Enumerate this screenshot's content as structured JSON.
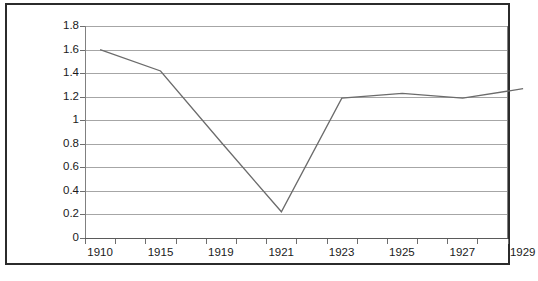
{
  "chart_data": {
    "type": "line",
    "title": "",
    "xlabel": "",
    "ylabel": "",
    "ylim": [
      0,
      1.8
    ],
    "ytick_values": [
      0,
      0.2,
      0.4,
      0.6,
      0.8,
      1,
      1.2,
      1.4,
      1.6,
      1.8
    ],
    "ytick_labels": [
      "0",
      "0.2",
      "0.4",
      "0.6",
      "0.8",
      "1",
      "1.2",
      "1.4",
      "1.6",
      "1.8"
    ],
    "grid": true,
    "grid_axis": "y",
    "legend": false,
    "legend_position": "none",
    "categories": [
      "1910",
      "1915",
      "1919",
      "1921",
      "1923",
      "1925",
      "1927",
      "1929"
    ],
    "xtick_labels": [
      "1910",
      "1915",
      "1919",
      "1921",
      "1923",
      "1925",
      "1927",
      "1929"
    ],
    "x": [
      1910,
      1915,
      1919,
      1921,
      1923,
      1925,
      1927,
      1929
    ],
    "values": [
      1.6,
      1.42,
      0.82,
      0.23,
      1.19,
      1.23,
      1.19,
      1.27
    ],
    "series": [
      {
        "name": "",
        "values": [
          1.6,
          1.42,
          0.82,
          0.23,
          1.19,
          1.23,
          1.19,
          1.27
        ]
      }
    ],
    "line_color": "#6b6b6b",
    "grid_color": "#a6a6a6",
    "axis_color": "#808080",
    "background_color": "#ffffff",
    "border_color": "#2b2b2b"
  },
  "caption": {
    "text": ""
  }
}
